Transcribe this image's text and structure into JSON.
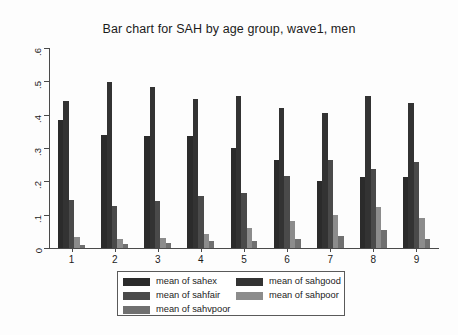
{
  "chart_data": {
    "type": "bar",
    "title": "Bar chart for SAH by age group, wave1, men",
    "xlabel": "",
    "ylabel": "",
    "ylim": [
      0,
      0.6
    ],
    "ytick_labels": [
      "0",
      ".1",
      ".2",
      ".3",
      ".4",
      ".5",
      ".6"
    ],
    "ytick_values": [
      0,
      0.1,
      0.2,
      0.3,
      0.4,
      0.5,
      0.6
    ],
    "grid": false,
    "legend_position": "bottom",
    "categories": [
      "1",
      "2",
      "3",
      "4",
      "5",
      "6",
      "7",
      "8",
      "9"
    ],
    "series": [
      {
        "name": "mean of sahex",
        "color": "#2b2b2b",
        "values": [
          0.385,
          0.34,
          0.335,
          0.335,
          0.3,
          0.265,
          0.2,
          0.212,
          0.212
        ]
      },
      {
        "name": "mean of sahgood",
        "color": "#333333",
        "values": [
          0.44,
          0.497,
          0.482,
          0.448,
          0.455,
          0.42,
          0.405,
          0.455,
          0.435
        ]
      },
      {
        "name": "mean of sahfair",
        "color": "#4a4a4a",
        "values": [
          0.145,
          0.125,
          0.14,
          0.155,
          0.165,
          0.215,
          0.265,
          0.238,
          0.258
        ]
      },
      {
        "name": "mean of sahpoor",
        "color": "#8c8c8c",
        "values": [
          0.032,
          0.027,
          0.03,
          0.042,
          0.06,
          0.08,
          0.1,
          0.122,
          0.09
        ]
      },
      {
        "name": "mean of sahvpoor",
        "color": "#707070",
        "values": [
          0.01,
          0.012,
          0.014,
          0.02,
          0.022,
          0.028,
          0.035,
          0.055,
          0.028
        ]
      }
    ],
    "legend_order": [
      "mean of sahex",
      "mean of sahgood",
      "mean of sahfair",
      "mean of sahpoor",
      "mean of sahvpoor"
    ]
  },
  "legend": {
    "left_column": [
      {
        "label": "mean of sahex",
        "color": "#2b2b2b"
      },
      {
        "label": "mean of sahfair",
        "color": "#4a4a4a"
      },
      {
        "label": "mean of sahvpoor",
        "color": "#707070"
      }
    ],
    "right_column": [
      {
        "label": "mean of sahgood",
        "color": "#333333"
      },
      {
        "label": "mean of sahpoor",
        "color": "#8c8c8c"
      }
    ]
  }
}
